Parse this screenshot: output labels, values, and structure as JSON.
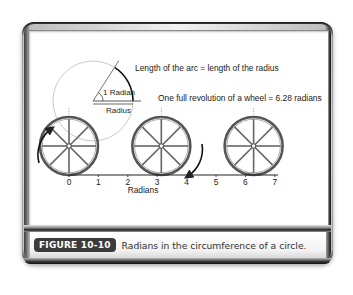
{
  "figure": {
    "badge": "FIGURE 10-10",
    "caption": "Radians in the circumference of a circle."
  },
  "diagram": {
    "arc_label": "Length of the arc = length of the radius",
    "revolution_label": "One full revolution of a wheel = 6.28 radians",
    "angle_label": "1 Radian",
    "radius_label": "Radius",
    "axis_title": "Radians",
    "axis_ticks": [
      "0",
      "1",
      "2",
      "3",
      "4",
      "5",
      "6",
      "7"
    ],
    "angle_radians": 1,
    "wheel_positions_radians": [
      0,
      3.14,
      6.28
    ],
    "wheel_spokes": 8
  },
  "colors": {
    "ink": "#222222",
    "wheel": "#555555",
    "badge_bg": "#3b3b3b"
  }
}
